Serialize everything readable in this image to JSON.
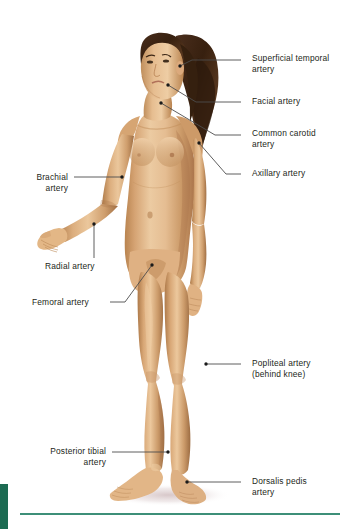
{
  "figure": {
    "skin_base": "#d8a87a",
    "skin_light": "#e8c59b",
    "skin_shadow": "#b3804f",
    "hair_color": "#3d2519",
    "background": "#ffffff"
  },
  "style": {
    "accent_green": "#1c6b52",
    "rule_green": "#3d8f78",
    "leader_color": "#4d4d4d",
    "label_color": "#231f20"
  },
  "labels": [
    {
      "id": "superficial-temporal-artery",
      "text": "Superficial temporal\nartery",
      "side": "right",
      "text_x": 252,
      "text_y": 53,
      "leader": [
        [
          241,
          60
        ],
        [
          192,
          60
        ],
        [
          180,
          66
        ]
      ],
      "dot": [
        180,
        66
      ]
    },
    {
      "id": "facial-artery",
      "text": "Facial artery",
      "side": "right",
      "text_x": 252,
      "text_y": 96,
      "leader": [
        [
          241,
          102
        ],
        [
          196,
          102
        ],
        [
          168,
          85
        ]
      ],
      "dot": [
        168,
        85
      ]
    },
    {
      "id": "common-carotid-artery",
      "text": "Common carotid\nartery",
      "side": "right",
      "text_x": 252,
      "text_y": 128,
      "leader": [
        [
          241,
          135
        ],
        [
          215,
          135
        ],
        [
          161,
          103
        ]
      ],
      "dot": [
        161,
        103
      ]
    },
    {
      "id": "axillary-artery",
      "text": "Axillary artery",
      "side": "right",
      "text_x": 252,
      "text_y": 168,
      "leader": [
        [
          241,
          174
        ],
        [
          226,
          174
        ],
        [
          199,
          143
        ]
      ],
      "dot": [
        199,
        143
      ]
    },
    {
      "id": "brachial-artery",
      "text": "Brachial\nartery",
      "side": "left",
      "text_x": 18,
      "text_y": 172,
      "text_w": 50,
      "leader": [
        [
          74,
          177
        ],
        [
          122,
          177
        ]
      ],
      "dot": [
        122,
        177
      ]
    },
    {
      "id": "radial-artery",
      "text": "Radial artery",
      "side": "left",
      "text_x": 45,
      "text_y": 261,
      "leader": [
        [
          94,
          258
        ],
        [
          94,
          224
        ]
      ],
      "dot": [
        94,
        224
      ]
    },
    {
      "id": "femoral-artery",
      "text": "Femoral artery",
      "side": "left",
      "text_x": 32,
      "text_y": 297,
      "leader": [
        [
          110,
          302
        ],
        [
          125,
          302
        ],
        [
          152,
          265
        ]
      ],
      "dot": [
        152,
        265
      ]
    },
    {
      "id": "popliteal-artery",
      "text": "Popliteal artery\n(behind knee)",
      "side": "right",
      "text_x": 252,
      "text_y": 358,
      "leader": [
        [
          241,
          364
        ],
        [
          206,
          364
        ]
      ],
      "dot": [
        206,
        364
      ]
    },
    {
      "id": "posterior-tibial-artery",
      "text": "Posterior tibial\nartery",
      "side": "left",
      "text_x": 22,
      "text_y": 446,
      "text_w": 84,
      "leader": [
        [
          112,
          452
        ],
        [
          168,
          452
        ]
      ],
      "dot": [
        168,
        452
      ]
    },
    {
      "id": "dorsalis-pedis-artery",
      "text": "Dorsalis pedis\nartery",
      "side": "right",
      "text_x": 252,
      "text_y": 476,
      "leader": [
        [
          241,
          482
        ],
        [
          187,
          482
        ]
      ],
      "dot": [
        187,
        482
      ]
    }
  ]
}
